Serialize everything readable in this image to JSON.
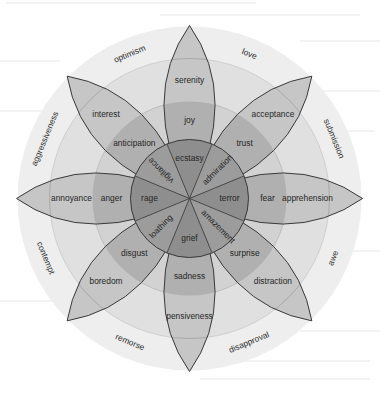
{
  "petals": [
    {
      "key": "joy-petal",
      "angle_deg": 0,
      "mild": "serenity",
      "basic": "joy",
      "intense": "ecstasy",
      "intense_rotated": false
    },
    {
      "key": "trust-petal",
      "angle_deg": 45,
      "mild": "acceptance",
      "basic": "trust",
      "intense": "admiration",
      "intense_rotated": true
    },
    {
      "key": "fear-petal",
      "angle_deg": 90,
      "mild": "apprehension",
      "basic": "fear",
      "intense": "terror",
      "intense_rotated": false
    },
    {
      "key": "surprise-petal",
      "angle_deg": 135,
      "mild": "distraction",
      "basic": "surprise",
      "intense": "amazement",
      "intense_rotated": true
    },
    {
      "key": "sadness-petal",
      "angle_deg": 180,
      "mild": "pensiveness",
      "basic": "sadness",
      "intense": "grief",
      "intense_rotated": false
    },
    {
      "key": "disgust-petal",
      "angle_deg": 225,
      "mild": "boredom",
      "basic": "disgust",
      "intense": "loathing",
      "intense_rotated": true
    },
    {
      "key": "anger-petal",
      "angle_deg": 270,
      "mild": "annoyance",
      "basic": "anger",
      "intense": "rage",
      "intense_rotated": false
    },
    {
      "key": "anticipation-petal",
      "angle_deg": 315,
      "mild": "interest",
      "basic": "anticipation",
      "intense": "vigilance",
      "intense_rotated": true
    }
  ],
  "dyads": [
    {
      "angle_deg": 22.5,
      "label": "love"
    },
    {
      "angle_deg": 67.5,
      "label": "submission"
    },
    {
      "angle_deg": 112.5,
      "label": "awe"
    },
    {
      "angle_deg": 157.5,
      "label": "disapproval"
    },
    {
      "angle_deg": 202.5,
      "label": "remorse"
    },
    {
      "angle_deg": 247.5,
      "label": "contempt"
    },
    {
      "angle_deg": 292.5,
      "label": "aggressiveness"
    },
    {
      "angle_deg": 337.5,
      "label": "optimism"
    }
  ],
  "colors": {
    "background": "#ffffff",
    "outer_disc": "#eeeeee",
    "ring_outer": "#e0e0e0",
    "ring_middle": "#d2d2d2",
    "petal_mild": "#c6c6c6",
    "petal_basic": "#b0b0b0",
    "center": "#8e8e8e",
    "outline": "#3a3a3a",
    "text": "#262626"
  }
}
